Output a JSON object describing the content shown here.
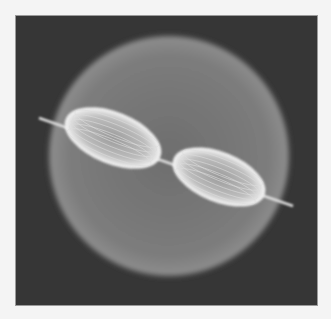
{
  "image": {
    "subject": "bipolar nebula with jet inside spherical shell",
    "colors": {
      "page_background": "#f4f4f4",
      "frame_background": "#363636",
      "shell": "#8a8a8a",
      "lobes": "#e8e8e8"
    },
    "frame": {
      "x": 15,
      "y": 15,
      "width": 303,
      "height": 291
    },
    "shell": {
      "cx": 168,
      "cy": 155,
      "r": 124
    },
    "lobes": [
      {
        "name": "left-lobe",
        "cx": 112,
        "cy": 137,
        "rx": 50,
        "ry": 25,
        "rotate": 22
      },
      {
        "name": "right-lobe",
        "cx": 218,
        "cy": 176,
        "rx": 48,
        "ry": 24,
        "rotate": 22
      }
    ],
    "jet": {
      "x1": 38,
      "y1": 117,
      "x2": 292,
      "y2": 205
    }
  }
}
